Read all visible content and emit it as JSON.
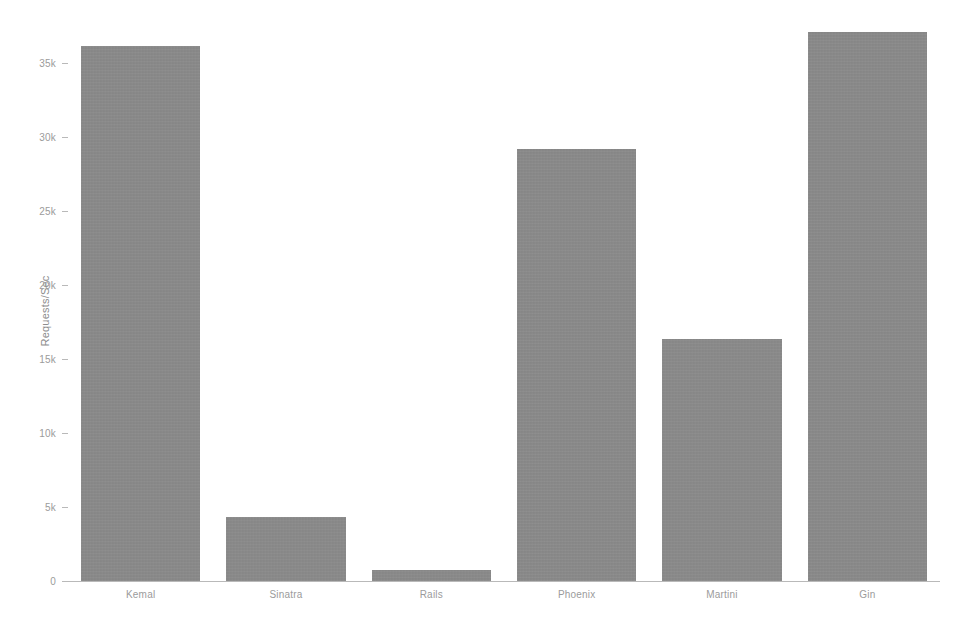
{
  "chart_data": {
    "type": "bar",
    "title": "",
    "xlabel": "",
    "ylabel": "Requests/Sec",
    "categories": [
      "Kemal",
      "Sinatra",
      "Rails",
      "Phoenix",
      "Martini",
      "Gin"
    ],
    "values": [
      36150,
      4330,
      750,
      29200,
      16350,
      37100
    ],
    "ylim": [
      0,
      37800
    ],
    "yticks": [
      0,
      5000,
      10000,
      15000,
      20000,
      25000,
      30000,
      35000
    ],
    "ytick_labels": [
      "0",
      "5k",
      "10k",
      "15k",
      "20k",
      "25k",
      "30k",
      "35k"
    ],
    "grid": false,
    "legend": null,
    "bar_color": "#8b8b8b",
    "axis_color": "#b9b9b9",
    "text_color": "#9b9b9b",
    "background": "#ffffff"
  },
  "axis": {
    "y_title": "Requests/Sec"
  },
  "ticks": [
    {
      "label": "0",
      "value": 0
    },
    {
      "label": "5k",
      "value": 5000
    },
    {
      "label": "10k",
      "value": 10000
    },
    {
      "label": "15k",
      "value": 15000
    },
    {
      "label": "20k",
      "value": 20000
    },
    {
      "label": "25k",
      "value": 25000
    },
    {
      "label": "30k",
      "value": 30000
    },
    {
      "label": "35k",
      "value": 35000
    }
  ],
  "bars": [
    {
      "label": "Kemal",
      "value": 36150
    },
    {
      "label": "Sinatra",
      "value": 4330
    },
    {
      "label": "Rails",
      "value": 750
    },
    {
      "label": "Phoenix",
      "value": 29200
    },
    {
      "label": "Martini",
      "value": 16350
    },
    {
      "label": "Gin",
      "value": 37100
    }
  ]
}
